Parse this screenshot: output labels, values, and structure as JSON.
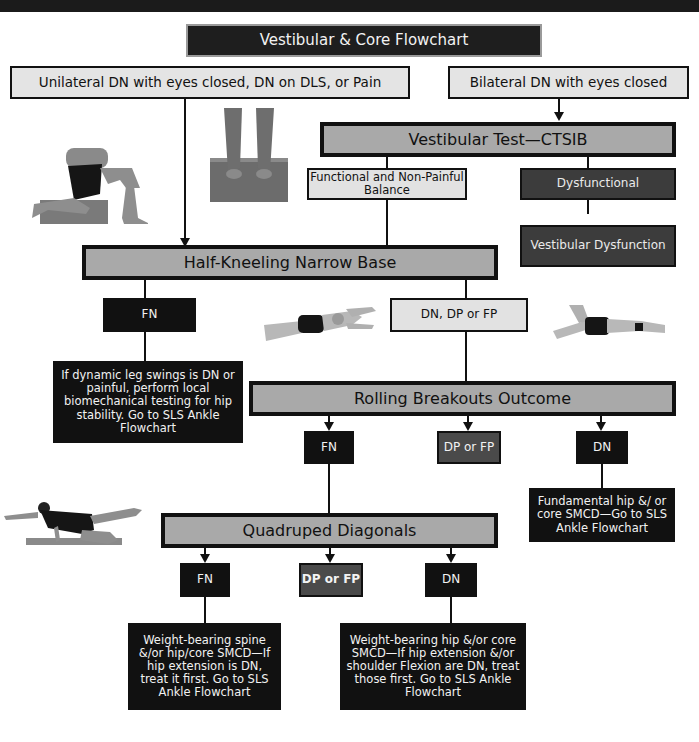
{
  "title": "Vestibular & Core Flowchart",
  "entry_points": {
    "unilateral": "Unilateral DN with eyes closed, DN on DLS, or Pain",
    "bilateral": "Bilateral DN with eyes closed"
  },
  "vestibular_test": {
    "label": "Vestibular Test—CTSIB",
    "functional": "Functional and Non-Painful Balance",
    "dysfunctional": "Dysfunctional",
    "vestibular_dysfunction": "Vestibular Dysfunction"
  },
  "half_kneeling": {
    "label": "Half-Kneeling Narrow Base",
    "fn": "FN",
    "fn_note": "If dynamic leg swings is DN or painful, perform local biomechanical testing for hip stability. Go to SLS Ankle Flowchart",
    "other": "DN, DP or FP"
  },
  "rolling_breakouts": {
    "label": "Rolling Breakouts Outcome",
    "fn": "FN",
    "dp_fp": "DP or FP",
    "dn": "DN",
    "dn_note": "Fundamental hip &/ or core SMCD—Go to SLS Ankle Flowchart"
  },
  "quadruped": {
    "label": "Quadruped Diagonals",
    "fn": "FN",
    "dp_fp": "DP or FP",
    "dn": "DN",
    "fn_note": "Weight-bearing spine &/or hip/core SMCD—If hip extension is DN, treat it first.  Go to SLS Ankle Flowchart",
    "dn_note": "Weight-bearing hip &/or core SMCD—If hip extension &/or shoulder Flexion are DN, treat those first. Go to SLS Ankle Flowchart"
  },
  "photos": {
    "half_kneeling": "half-kneeling-photo",
    "standing_feet": "standing-on-foam-photo",
    "rolling_left": "rolling-breakout-photo-left",
    "rolling_right": "rolling-breakout-photo-right",
    "quadruped": "quadruped-diagonal-photo"
  },
  "colors": {
    "stage_fill": "#a9a9a9",
    "entry_fill": "#e4e4e4",
    "dark_fill": "#111111",
    "dysfunction_fill": "#3c3c3c",
    "dp_fp_fill": "#4a4a4a"
  }
}
